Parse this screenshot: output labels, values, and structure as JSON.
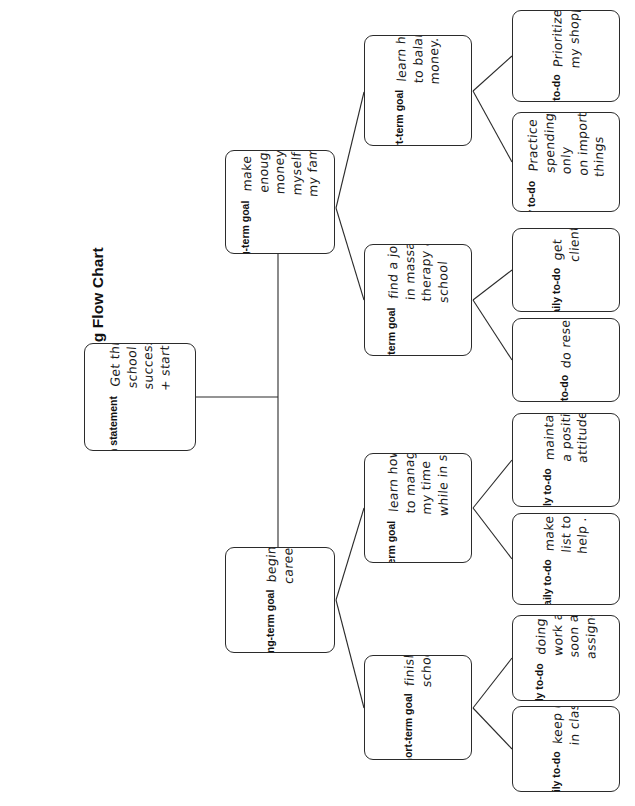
{
  "title": "Goal-Setting Flow Chart",
  "labels": {
    "mission": "Mission statement",
    "long_term": "Long-term goal",
    "short_term": "Short-term goal",
    "daily": "Daily to-do"
  },
  "mission": {
    "label": "Mission statement",
    "lines": [
      "Get through",
      "school",
      "successfully",
      "+ start fresh"
    ]
  },
  "branches": [
    {
      "long_term": {
        "label": "Long-term goal",
        "lines": [
          "make",
          "enough",
          "money for",
          "myself +",
          "my family"
        ]
      },
      "short_terms": [
        {
          "label": "Short-term goal",
          "lines": [
            "learn how",
            "to balance",
            "money."
          ],
          "todos": [
            {
              "label": "Daily to-do",
              "lines": [
                "Prioritize",
                "my shopping"
              ]
            },
            {
              "label": "Daily to-do",
              "lines": [
                "Practice",
                "spending",
                "only",
                "on important",
                "things"
              ]
            }
          ]
        },
        {
          "label": "Short-term goal",
          "lines": [
            "find a job",
            "in massage",
            "therapy after",
            "school"
          ],
          "todos": [
            {
              "label": "Daily to-do",
              "lines": [
                "get",
                "clients"
              ]
            },
            {
              "label": "Daily to-do",
              "lines": [
                "do research"
              ]
            }
          ]
        }
      ]
    },
    {
      "long_term": {
        "label": "Long-term goal",
        "lines": [
          "begin a",
          "career"
        ]
      },
      "short_terms": [
        {
          "label": "Short-term goal",
          "lines": [
            "learn how",
            "to manage",
            "my time",
            "while in school"
          ],
          "todos": [
            {
              "label": "Daily to-do",
              "lines": [
                "maintain",
                "a positive",
                "attitude"
              ]
            },
            {
              "label": "Daily to-do",
              "lines": [
                "make a",
                "list to",
                "help ."
              ]
            }
          ]
        },
        {
          "label": "Short-term goal",
          "lines": [
            "finish",
            "school"
          ],
          "todos": [
            {
              "label": "Daily to-do",
              "lines": [
                "doing",
                "work as",
                "soon as",
                "assigned"
              ]
            },
            {
              "label": "Daily to-do",
              "lines": [
                "keep up",
                "in class"
              ]
            }
          ]
        }
      ]
    }
  ],
  "colors": {
    "ink": "#2b2b2b",
    "background": "#ffffff"
  }
}
